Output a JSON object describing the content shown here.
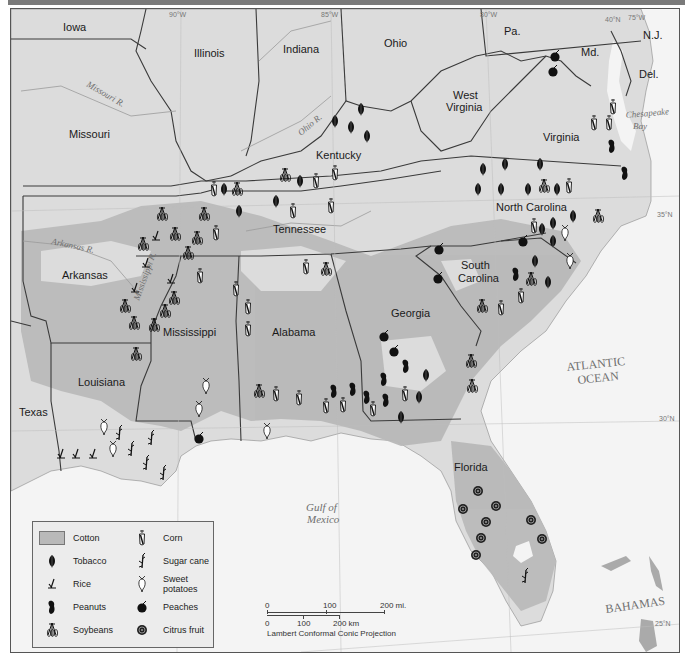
{
  "map": {
    "title_bar_color": "#7a7a7a",
    "colors": {
      "land": "#dcdcdc",
      "cotton": "#b9b9b9",
      "water": "#f4f4f4",
      "border": "#3a3a3a",
      "river": "#9a9a9a",
      "symbol": "#111111"
    },
    "states": [
      {
        "name": "Iowa",
        "x": 62,
        "y": 30
      },
      {
        "name": "Illinois",
        "x": 193,
        "y": 56
      },
      {
        "name": "Indiana",
        "x": 282,
        "y": 52
      },
      {
        "name": "Ohio",
        "x": 383,
        "y": 46
      },
      {
        "name": "Pa.",
        "x": 503,
        "y": 34
      },
      {
        "name": "Md.",
        "x": 580,
        "y": 55
      },
      {
        "name": "N.J.",
        "x": 642,
        "y": 38
      },
      {
        "name": "Del.",
        "x": 638,
        "y": 77
      },
      {
        "name": "Missouri",
        "x": 68,
        "y": 137
      },
      {
        "name": "West",
        "x": 452,
        "y": 98
      },
      {
        "name": "Virginia",
        "x": 445,
        "y": 110
      },
      {
        "name": "Virginia",
        "x": 542,
        "y": 140
      },
      {
        "name": "Kentucky",
        "x": 315,
        "y": 158
      },
      {
        "name": "North Carolina",
        "x": 495,
        "y": 210
      },
      {
        "name": "Tennessee",
        "x": 272,
        "y": 232
      },
      {
        "name": "Arkansas",
        "x": 61,
        "y": 278
      },
      {
        "name": "South",
        "x": 460,
        "y": 268
      },
      {
        "name": "Carolina",
        "x": 457,
        "y": 281
      },
      {
        "name": "Mississippi",
        "x": 162,
        "y": 335
      },
      {
        "name": "Alabama",
        "x": 271,
        "y": 335
      },
      {
        "name": "Georgia",
        "x": 390,
        "y": 316
      },
      {
        "name": "Louisiana",
        "x": 77,
        "y": 385
      },
      {
        "name": "Texas",
        "x": 18,
        "y": 415
      },
      {
        "name": "Florida",
        "x": 453,
        "y": 470
      }
    ],
    "water_labels": [
      {
        "text": "ATLANTIC",
        "x": 566,
        "y": 370,
        "style": "water"
      },
      {
        "text": "OCEAN",
        "x": 577,
        "y": 383,
        "style": "water"
      },
      {
        "text": "Gulf of",
        "x": 305,
        "y": 510,
        "style": "italic"
      },
      {
        "text": "Mexico",
        "x": 306,
        "y": 522,
        "style": "italic"
      },
      {
        "text": "BAHAMAS",
        "x": 605,
        "y": 612,
        "style": "water"
      }
    ],
    "river_labels": [
      {
        "text": "Missouri R.",
        "x": 85,
        "y": 85,
        "rotate": 30
      },
      {
        "text": "Ohio R.",
        "x": 300,
        "y": 135,
        "rotate": -40
      },
      {
        "text": "Arkansas R.",
        "x": 50,
        "y": 243,
        "rotate": 12
      },
      {
        "text": "Mississippi R.",
        "x": 138,
        "y": 300,
        "rotate": -70
      },
      {
        "text": "Chesapeake",
        "x": 625,
        "y": 117,
        "rotate": -5
      },
      {
        "text": "Bay",
        "x": 632,
        "y": 128,
        "rotate": 0
      }
    ],
    "coordinates": [
      {
        "text": "90°W",
        "x": 168,
        "y": 16
      },
      {
        "text": "85°W",
        "x": 320,
        "y": 16
      },
      {
        "text": "80°W",
        "x": 479,
        "y": 16
      },
      {
        "text": "40°N",
        "x": 604,
        "y": 21
      },
      {
        "text": "75°W",
        "x": 627,
        "y": 19
      },
      {
        "text": "35°N",
        "x": 656,
        "y": 216
      },
      {
        "text": "30°N",
        "x": 658,
        "y": 420
      },
      {
        "text": "25°N",
        "x": 654,
        "y": 625
      }
    ],
    "symbols": [
      {
        "type": "peaches",
        "x": 554,
        "y": 55
      },
      {
        "type": "peaches",
        "x": 552,
        "y": 70
      },
      {
        "type": "corn",
        "x": 612,
        "y": 106
      },
      {
        "type": "corn",
        "x": 593,
        "y": 122
      },
      {
        "type": "corn",
        "x": 608,
        "y": 122
      },
      {
        "type": "peanuts",
        "x": 611,
        "y": 145
      },
      {
        "type": "peanuts",
        "x": 624,
        "y": 172
      },
      {
        "type": "tobacco",
        "x": 360,
        "y": 108
      },
      {
        "type": "tobacco",
        "x": 350,
        "y": 126
      },
      {
        "type": "tobacco",
        "x": 366,
        "y": 135
      },
      {
        "type": "tobacco",
        "x": 334,
        "y": 120
      },
      {
        "type": "tobacco",
        "x": 482,
        "y": 168
      },
      {
        "type": "tobacco",
        "x": 504,
        "y": 163
      },
      {
        "type": "tobacco",
        "x": 539,
        "y": 163
      },
      {
        "type": "tobacco",
        "x": 477,
        "y": 188
      },
      {
        "type": "tobacco",
        "x": 500,
        "y": 188
      },
      {
        "type": "tobacco",
        "x": 527,
        "y": 188
      },
      {
        "type": "soybeans",
        "x": 543,
        "y": 185
      },
      {
        "type": "tobacco",
        "x": 556,
        "y": 188
      },
      {
        "type": "corn",
        "x": 568,
        "y": 185
      },
      {
        "type": "tobacco",
        "x": 572,
        "y": 215
      },
      {
        "type": "soybeans",
        "x": 597,
        "y": 215
      },
      {
        "type": "corn",
        "x": 533,
        "y": 225
      },
      {
        "type": "tobacco",
        "x": 541,
        "y": 228
      },
      {
        "type": "tobacco",
        "x": 552,
        "y": 222
      },
      {
        "type": "sweet_potatoes",
        "x": 564,
        "y": 232
      },
      {
        "type": "tobacco",
        "x": 552,
        "y": 240
      },
      {
        "type": "sweet_potatoes",
        "x": 569,
        "y": 260
      },
      {
        "type": "peaches",
        "x": 522,
        "y": 240
      },
      {
        "type": "tobacco",
        "x": 534,
        "y": 260
      },
      {
        "type": "peanuts",
        "x": 515,
        "y": 273
      },
      {
        "type": "soybeans",
        "x": 530,
        "y": 278
      },
      {
        "type": "tobacco",
        "x": 547,
        "y": 281
      },
      {
        "type": "corn",
        "x": 520,
        "y": 295
      },
      {
        "type": "soybeans",
        "x": 481,
        "y": 305
      },
      {
        "type": "corn",
        "x": 500,
        "y": 307
      },
      {
        "type": "peaches",
        "x": 438,
        "y": 248
      },
      {
        "type": "peaches",
        "x": 437,
        "y": 277
      },
      {
        "type": "soybeans",
        "x": 284,
        "y": 174
      },
      {
        "type": "tobacco",
        "x": 299,
        "y": 180
      },
      {
        "type": "corn",
        "x": 315,
        "y": 180
      },
      {
        "type": "corn",
        "x": 334,
        "y": 172
      },
      {
        "type": "corn",
        "x": 213,
        "y": 188
      },
      {
        "type": "tobacco",
        "x": 223,
        "y": 188
      },
      {
        "type": "soybeans",
        "x": 236,
        "y": 188
      },
      {
        "type": "tobacco",
        "x": 275,
        "y": 200
      },
      {
        "type": "corn",
        "x": 292,
        "y": 210
      },
      {
        "type": "corn",
        "x": 330,
        "y": 205
      },
      {
        "type": "tobacco",
        "x": 238,
        "y": 210
      },
      {
        "type": "soybeans",
        "x": 161,
        "y": 213
      },
      {
        "type": "soybeans",
        "x": 174,
        "y": 233
      },
      {
        "type": "soybeans",
        "x": 196,
        "y": 237
      },
      {
        "type": "soybeans",
        "x": 203,
        "y": 213
      },
      {
        "type": "corn",
        "x": 215,
        "y": 232
      },
      {
        "type": "soybeans",
        "x": 142,
        "y": 243
      },
      {
        "type": "rice",
        "x": 155,
        "y": 235
      },
      {
        "type": "rice",
        "x": 145,
        "y": 262
      },
      {
        "type": "soybeans",
        "x": 187,
        "y": 252
      },
      {
        "type": "corn",
        "x": 199,
        "y": 275
      },
      {
        "type": "corn",
        "x": 235,
        "y": 288
      },
      {
        "type": "corn",
        "x": 247,
        "y": 306
      },
      {
        "type": "corn",
        "x": 247,
        "y": 328
      },
      {
        "type": "corn",
        "x": 305,
        "y": 266
      },
      {
        "type": "soybeans",
        "x": 325,
        "y": 268
      },
      {
        "type": "rice",
        "x": 170,
        "y": 278
      },
      {
        "type": "rice",
        "x": 134,
        "y": 287
      },
      {
        "type": "soybeans",
        "x": 173,
        "y": 297
      },
      {
        "type": "soybeans",
        "x": 164,
        "y": 310
      },
      {
        "type": "soybeans",
        "x": 124,
        "y": 305
      },
      {
        "type": "soybeans",
        "x": 133,
        "y": 322
      },
      {
        "type": "soybeans",
        "x": 153,
        "y": 324
      },
      {
        "type": "soybeans",
        "x": 135,
        "y": 353
      },
      {
        "type": "sweet_potatoes",
        "x": 205,
        "y": 385
      },
      {
        "type": "sweet_potatoes",
        "x": 198,
        "y": 408
      },
      {
        "type": "peaches",
        "x": 198,
        "y": 437
      },
      {
        "type": "sweet_potatoes",
        "x": 103,
        "y": 426
      },
      {
        "type": "sugar_cane",
        "x": 118,
        "y": 432
      },
      {
        "type": "sweet_potatoes",
        "x": 112,
        "y": 448
      },
      {
        "type": "sugar_cane",
        "x": 130,
        "y": 448
      },
      {
        "type": "sugar_cane",
        "x": 150,
        "y": 437
      },
      {
        "type": "sugar_cane",
        "x": 145,
        "y": 462
      },
      {
        "type": "sugar_cane",
        "x": 162,
        "y": 472
      },
      {
        "type": "rice",
        "x": 60,
        "y": 453
      },
      {
        "type": "rice",
        "x": 75,
        "y": 453
      },
      {
        "type": "rice",
        "x": 92,
        "y": 453
      },
      {
        "type": "soybeans",
        "x": 258,
        "y": 390
      },
      {
        "type": "corn",
        "x": 275,
        "y": 393
      },
      {
        "type": "corn",
        "x": 298,
        "y": 397
      },
      {
        "type": "peanuts",
        "x": 333,
        "y": 390
      },
      {
        "type": "corn",
        "x": 325,
        "y": 405
      },
      {
        "type": "peanuts",
        "x": 352,
        "y": 388
      },
      {
        "type": "corn",
        "x": 342,
        "y": 404
      },
      {
        "type": "peanuts",
        "x": 366,
        "y": 396
      },
      {
        "type": "corn",
        "x": 372,
        "y": 408
      },
      {
        "type": "peanuts",
        "x": 383,
        "y": 378
      },
      {
        "type": "peanuts",
        "x": 385,
        "y": 399
      },
      {
        "type": "peanuts",
        "x": 405,
        "y": 365
      },
      {
        "type": "corn",
        "x": 404,
        "y": 393
      },
      {
        "type": "tobacco",
        "x": 400,
        "y": 416
      },
      {
        "type": "tobacco",
        "x": 425,
        "y": 374
      },
      {
        "type": "tobacco",
        "x": 418,
        "y": 396
      },
      {
        "type": "peaches",
        "x": 383,
        "y": 335
      },
      {
        "type": "peaches",
        "x": 393,
        "y": 350
      },
      {
        "type": "soybeans",
        "x": 470,
        "y": 360
      },
      {
        "type": "soybeans",
        "x": 471,
        "y": 385
      },
      {
        "type": "sweet_potatoes",
        "x": 266,
        "y": 430
      },
      {
        "type": "citrus",
        "x": 477,
        "y": 490
      },
      {
        "type": "citrus",
        "x": 462,
        "y": 508
      },
      {
        "type": "citrus",
        "x": 495,
        "y": 505
      },
      {
        "type": "citrus",
        "x": 485,
        "y": 521
      },
      {
        "type": "citrus",
        "x": 480,
        "y": 537
      },
      {
        "type": "citrus",
        "x": 475,
        "y": 554
      },
      {
        "type": "citrus",
        "x": 530,
        "y": 519
      },
      {
        "type": "citrus",
        "x": 541,
        "y": 538
      },
      {
        "type": "sugar_cane",
        "x": 524,
        "y": 575
      }
    ]
  },
  "legend": {
    "items": [
      {
        "key": "cotton",
        "label": "Cotton"
      },
      {
        "key": "tobacco",
        "label": "Tobacco"
      },
      {
        "key": "rice",
        "label": "Rice"
      },
      {
        "key": "peanuts",
        "label": "Peanuts"
      },
      {
        "key": "soybeans",
        "label": "Soybeans"
      },
      {
        "key": "corn",
        "label": "Corn"
      },
      {
        "key": "sugar_cane",
        "label": "Sugar cane"
      },
      {
        "key": "sweet_potatoes",
        "label": "Sweet potatoes"
      },
      {
        "key": "peaches",
        "label": "Peaches"
      },
      {
        "key": "citrus",
        "label": "Citrus fruit"
      }
    ]
  },
  "scale_bar": {
    "mi_labels": [
      "0",
      "100",
      "200 mi."
    ],
    "km_labels": [
      "0",
      "100",
      "200 km"
    ],
    "projection": "Lambert Conformal Conic Projection"
  }
}
